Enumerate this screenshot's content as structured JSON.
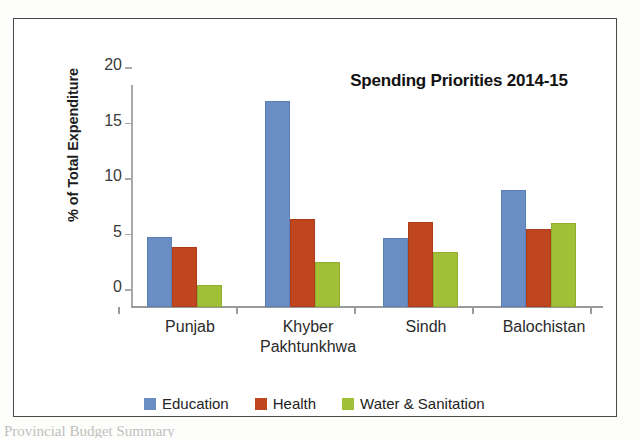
{
  "figure": {
    "frame_border_color": "#4a4a4a",
    "background": "#ffffff"
  },
  "chart_data": {
    "type": "bar",
    "title": "Spending Priorities 2014-15",
    "xlabel": "",
    "ylabel": "% of Total Expenditure",
    "categories": [
      "Punjab",
      "Khyber Pakhtunkhwa",
      "Sindh",
      "Balochistan"
    ],
    "category_lines": [
      [
        "Punjab"
      ],
      [
        "Khyber",
        "Pakhtunkhwa"
      ],
      [
        "Sindh"
      ],
      [
        "Balochistan"
      ]
    ],
    "series": [
      {
        "name": "Education",
        "color": "#6a8ec4",
        "values": [
          6.3,
          18.6,
          6.2,
          10.5
        ]
      },
      {
        "name": "Health",
        "color": "#c0461f",
        "values": [
          5.4,
          7.9,
          7.7,
          7.0
        ]
      },
      {
        "name": "Water & Sanitation",
        "color": "#9fc037",
        "values": [
          2.0,
          4.1,
          5.0,
          7.6
        ]
      }
    ],
    "ylim": [
      0,
      20
    ],
    "yticks": [
      0,
      5,
      10,
      15,
      20
    ],
    "ytick_labels": [
      "0",
      "5",
      "10",
      "15",
      "20"
    ],
    "grid": false,
    "legend_position": "bottom"
  },
  "caption": {
    "cut_off_text": "Provincial Budget Summary"
  }
}
